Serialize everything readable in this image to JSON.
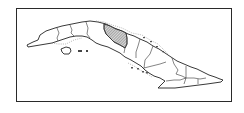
{
  "map": {
    "subject": "Cuba provinces locator map",
    "highlighted_region": "Villa Clara",
    "colors": {
      "frame": "#2a2a2a",
      "outline": "#222222",
      "highlight_hatch": "#555555",
      "background": "#ffffff"
    },
    "regions": [
      "Pinar del Río",
      "Artemisa",
      "La Habana",
      "Mayabeque",
      "Matanzas",
      "Cienfuegos",
      "Villa Clara",
      "Sancti Spíritus",
      "Ciego de Ávila",
      "Camagüey",
      "Las Tunas",
      "Holguín",
      "Granma",
      "Santiago de Cuba",
      "Guantánamo",
      "Isla de la Juventud"
    ]
  }
}
